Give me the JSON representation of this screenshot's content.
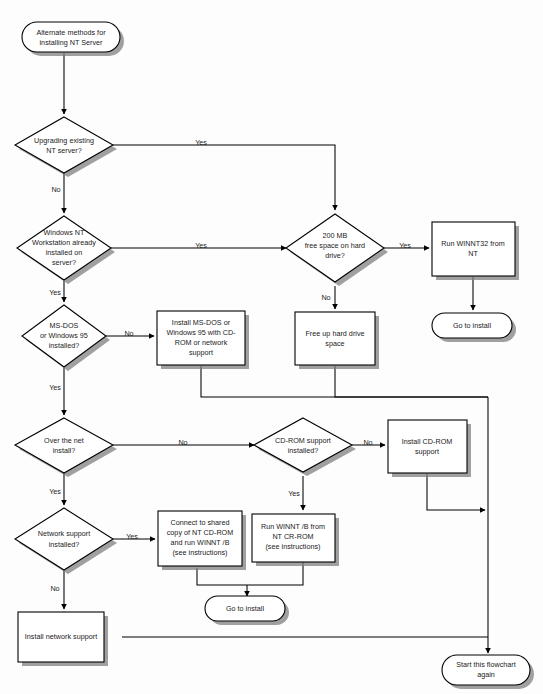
{
  "diagram": {
    "type": "flowchart",
    "colors": {
      "background": "#fdfdfd",
      "shape_fill": "#ffffff",
      "stroke": "#000000",
      "shadow": "#808080",
      "text": "#1a1a1a"
    }
  },
  "nodes": {
    "start": {
      "shape": "terminator",
      "lines": [
        "Alternate methods for",
        "installing NT Server"
      ]
    },
    "d_upgrading": {
      "shape": "decision",
      "lines": [
        "Upgrading existing",
        "NT server?"
      ]
    },
    "d_ntws": {
      "shape": "decision",
      "lines": [
        "Windows NT",
        "Workstation already",
        "installed on",
        "server?"
      ]
    },
    "d_msdos": {
      "shape": "decision",
      "lines": [
        "MS-DOS",
        "or Windows 95",
        "installed?"
      ]
    },
    "d_overnet": {
      "shape": "decision",
      "lines": [
        "Over the net",
        "install?"
      ]
    },
    "d_netsupport": {
      "shape": "decision",
      "lines": [
        "Network support",
        "installed?"
      ]
    },
    "d_200mb": {
      "shape": "decision",
      "lines": [
        "200 MB",
        "free space on hard",
        "drive?"
      ]
    },
    "d_cdrom": {
      "shape": "decision",
      "lines": [
        "CD-ROM support",
        "installed?"
      ]
    },
    "p_install_msdos": {
      "shape": "process",
      "lines": [
        "Install MS-DOS or",
        "Windows 95 with CD-",
        "ROM or network",
        "support"
      ]
    },
    "p_freeup": {
      "shape": "process",
      "lines": [
        "Free up hard drive",
        "space"
      ]
    },
    "p_winnt32": {
      "shape": "process",
      "lines": [
        "Run WINNT32 from",
        "NT"
      ]
    },
    "p_install_cdrom": {
      "shape": "process",
      "lines": [
        "Install CD-ROM",
        "support"
      ]
    },
    "p_connect_shared": {
      "shape": "process",
      "lines": [
        "Connect to shared",
        "copy of NT CD-ROM",
        "and run WINNT /B",
        "(see instructions)"
      ]
    },
    "p_run_winnt_b": {
      "shape": "process",
      "lines": [
        "Run WINNT /B from",
        "NT CR-ROM",
        "(see instructions)"
      ]
    },
    "p_install_network": {
      "shape": "process",
      "lines": [
        "Install network support"
      ]
    },
    "t_goto_install_right": {
      "shape": "terminator",
      "lines": [
        "Go to install"
      ]
    },
    "t_goto_install_mid": {
      "shape": "terminator",
      "lines": [
        "Go to install"
      ]
    },
    "t_start_again": {
      "shape": "terminator",
      "lines": [
        "Start this flowchart",
        "again"
      ]
    }
  },
  "edge_labels": {
    "upgrading_yes": "Yes",
    "upgrading_no": "No",
    "ntws_yes_right": "Yes",
    "ntws_yes_down": "Yes",
    "msdos_no": "No",
    "msdos_yes": "Yes",
    "overnet_no": "No",
    "overnet_yes": "Yes",
    "netsupport_yes": "Yes",
    "netsupport_no": "No",
    "mb200_yes": "Yes",
    "mb200_no": "No",
    "cdrom_no": "No",
    "cdrom_yes": "Yes"
  }
}
